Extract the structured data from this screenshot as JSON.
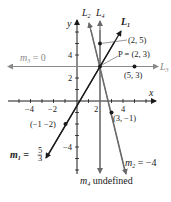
{
  "diagram": {
    "axes": {
      "x_label": "x",
      "y_label": "y",
      "x_ticks": [
        "−4",
        "−2",
        "2",
        "4"
      ],
      "y_ticks": [
        "4",
        "2",
        "−4"
      ]
    },
    "lines": [
      {
        "id": "L1",
        "label": "L",
        "sub": "1",
        "slope_label": "m",
        "slope_sub": "1",
        "slope_eq": " = ",
        "slope_num": "5",
        "slope_den": "3",
        "color": "#1a1a1a"
      },
      {
        "id": "L2",
        "label": "L",
        "sub": "2",
        "slope_label": "m",
        "slope_sub": "2",
        "slope_eq": " = −4",
        "color": "#6a6a6a"
      },
      {
        "id": "L3",
        "label": "L",
        "sub": "3",
        "slope_label": "m",
        "slope_sub": "3",
        "slope_eq": " = 0",
        "color": "#8a8a8a"
      },
      {
        "id": "L4",
        "label": "L",
        "sub": "4",
        "slope_label": "m",
        "slope_sub": "4",
        "slope_eq": " undefined",
        "color": "#6a6a6a"
      }
    ],
    "points": [
      {
        "label": "(2, 5)"
      },
      {
        "label": "P = (2, 3)"
      },
      {
        "label": "(5, 3)"
      },
      {
        "label": "(3, −1)"
      },
      {
        "label": "(−1 −2)"
      }
    ]
  }
}
